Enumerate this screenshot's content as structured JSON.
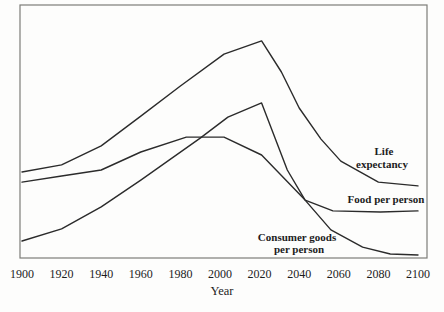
{
  "chart_data": {
    "type": "line",
    "title": "",
    "xlabel": "Year",
    "ylabel": "",
    "x_range": [
      1900,
      2100
    ],
    "x_ticks": [
      1900,
      1920,
      1940,
      1960,
      1980,
      2000,
      2020,
      2040,
      2060,
      2080,
      2100
    ],
    "y_axis_visible": false,
    "y_units": "relative index 0-100 (no scale shown on chart)",
    "grid": false,
    "legend": "inline text annotations next to each curve",
    "series": [
      {
        "name": "Life expectancy",
        "label_lines": [
          "Life",
          "expectancy"
        ],
        "points": [
          [
            1900,
            34.0
          ],
          [
            1920,
            36.8
          ],
          [
            1940,
            44.3
          ],
          [
            1960,
            56.1
          ],
          [
            1980,
            68.0
          ],
          [
            2002,
            80.6
          ],
          [
            2021,
            85.8
          ],
          [
            2031,
            73.5
          ],
          [
            2040,
            59.3
          ],
          [
            2051,
            47.0
          ],
          [
            2061,
            38.3
          ],
          [
            2080,
            30.0
          ],
          [
            2100,
            28.5
          ]
        ]
      },
      {
        "name": "Food per person",
        "label_lines": [
          "Food per person"
        ],
        "points": [
          [
            1900,
            30.0
          ],
          [
            1920,
            32.4
          ],
          [
            1940,
            34.8
          ],
          [
            1960,
            41.9
          ],
          [
            1983,
            47.8
          ],
          [
            2002,
            47.8
          ],
          [
            2021,
            40.7
          ],
          [
            2043,
            22.9
          ],
          [
            2057,
            18.6
          ],
          [
            2081,
            18.2
          ],
          [
            2100,
            18.6
          ]
        ]
      },
      {
        "name": "Consumer goods per person",
        "label_lines": [
          "Consumer goods",
          "per person"
        ],
        "points": [
          [
            1900,
            6.7
          ],
          [
            1920,
            11.5
          ],
          [
            1940,
            20.2
          ],
          [
            1960,
            30.8
          ],
          [
            1990,
            47.4
          ],
          [
            2004,
            55.7
          ],
          [
            2021,
            61.3
          ],
          [
            2034,
            34.8
          ],
          [
            2043,
            22.9
          ],
          [
            2056,
            11.1
          ],
          [
            2072,
            4.3
          ],
          [
            2086,
            1.6
          ],
          [
            2100,
            1.2
          ]
        ]
      }
    ]
  }
}
